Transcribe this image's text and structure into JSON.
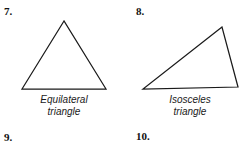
{
  "page": {
    "background_color": "#ffffff",
    "ink_color": "#1a1a1a",
    "width": 246,
    "height": 150
  },
  "problems": [
    {
      "number": "7.",
      "figure": "equilateral-triangle",
      "caption_line1": "Equilateral",
      "caption_line2": "triangle",
      "vertices": [
        [
          64,
          21
        ],
        [
          22,
          89
        ],
        [
          106,
          89
        ]
      ]
    },
    {
      "number": "8.",
      "figure": "isosceles-triangle",
      "caption_line1": "Isosceles",
      "caption_line2": "triangle",
      "vertices": [
        [
          222,
          27
        ],
        [
          143,
          89
        ],
        [
          238,
          87
        ]
      ]
    },
    {
      "number": "9.",
      "figure": "",
      "caption_line1": "",
      "caption_line2": "",
      "vertices": []
    },
    {
      "number": "10.",
      "figure": "",
      "caption_line1": "",
      "caption_line2": "",
      "vertices": []
    }
  ]
}
